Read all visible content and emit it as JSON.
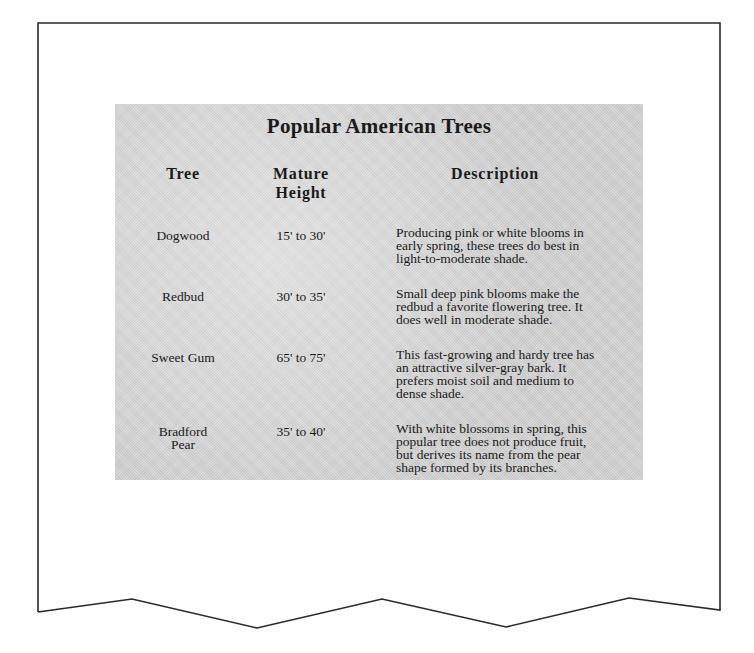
{
  "table": {
    "title": "Popular American Trees",
    "headers": {
      "tree": "Tree",
      "height_line1": "Mature",
      "height_line2": "Height",
      "description": "Description"
    },
    "rows": [
      {
        "tree_line1": "Dogwood",
        "tree_line2": "",
        "height": "15' to 30'",
        "description_lines": [
          "Producing pink or white blooms in",
          "early spring, these trees do best in",
          "light-to-moderate shade."
        ]
      },
      {
        "tree_line1": "Redbud",
        "tree_line2": "",
        "height": "30' to 35'",
        "description_lines": [
          "Small deep pink blooms make the",
          "redbud a favorite flowering tree. It",
          "does well in moderate shade."
        ]
      },
      {
        "tree_line1": "Sweet Gum",
        "tree_line2": "",
        "height": "65' to 75'",
        "description_lines": [
          "This fast-growing and hardy tree has",
          "an attractive silver-gray bark. It",
          "prefers moist soil and medium to",
          "dense shade."
        ]
      },
      {
        "tree_line1": "Bradford",
        "tree_line2": "Pear",
        "height": "35' to 40'",
        "description_lines": [
          "With white blossoms in spring, this",
          "popular tree does not produce fruit,",
          "but derives its name from the pear",
          "shape formed by its branches."
        ]
      }
    ]
  },
  "colors": {
    "page_border": "#2a2a2a",
    "panel_background": "#d2d2d2",
    "text": "#1a1a1a"
  }
}
